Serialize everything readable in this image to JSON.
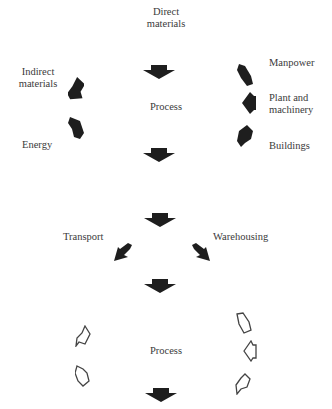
{
  "diagram": {
    "stage1": {
      "top_input": "Direct\nmaterials",
      "process_label": "Process",
      "left_inputs": [
        "Indirect\nmaterials",
        "Energy"
      ],
      "right_inputs": [
        "Manpower",
        "Plant and\nmachinery",
        "Buildings"
      ]
    },
    "stage2": {
      "left_output": "Transport",
      "right_output": "Warehousing"
    },
    "stage3": {
      "process_label": "Process"
    },
    "arrow_colors": {
      "solid": "#1e1e1e",
      "outline": "#444444"
    },
    "icons": {
      "solid_arrow": "block-down-arrow",
      "outline_arrow": "pentagon-outline-arrow"
    }
  }
}
